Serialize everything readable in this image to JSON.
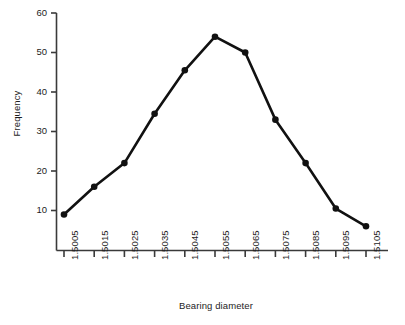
{
  "chart_data": {
    "type": "line",
    "title": "",
    "subtitle": "",
    "xlabel": "Bearing diameter",
    "ylabel": "Frequency",
    "categories": [
      "1.5005",
      "1.5015",
      "1.5025",
      "1.5035",
      "1.5045",
      "1.5055",
      "1.5065",
      "1.5075",
      "1.5085",
      "1.5095",
      "1.5105"
    ],
    "x": [
      1.5005,
      1.5015,
      1.5025,
      1.5035,
      1.5045,
      1.5055,
      1.5065,
      1.5075,
      1.5085,
      1.5095,
      1.5105
    ],
    "values": [
      9,
      16,
      22,
      34.5,
      45.5,
      54,
      50,
      33,
      22,
      10.5,
      6
    ],
    "series": [
      {
        "name": "Frequency",
        "values": [
          9,
          16,
          22,
          34.5,
          45.5,
          54,
          50,
          33,
          22,
          10.5,
          6
        ],
        "color": "#111111",
        "marker": "filled-circle"
      }
    ],
    "yticks": [
      10,
      20,
      30,
      40,
      50,
      60
    ],
    "ytick_labels": [
      "10",
      "20",
      "30",
      "40",
      "50",
      "60"
    ],
    "xtick_labels": [
      "1.5005",
      "1.5015",
      "1.5025",
      "1.5035",
      "1.5045",
      "1.5055",
      "1.5065",
      "1.5075",
      "1.5085",
      "1.5095",
      "1.5105"
    ],
    "ylim": [
      0,
      60
    ],
    "xlim": [
      1.5,
      1.511
    ],
    "grid": false,
    "legend": false,
    "legend_position": "none",
    "axis_color": "#3a3a3a",
    "line_color": "#111111",
    "background_color": "#ffffff"
  }
}
